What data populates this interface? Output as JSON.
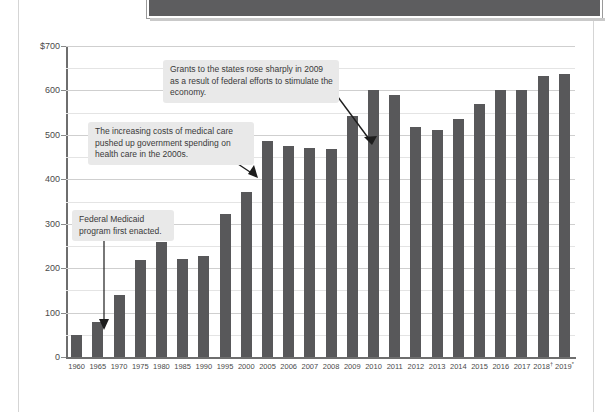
{
  "page": {
    "header_band_label": ""
  },
  "chart_data": {
    "type": "bar",
    "title": "",
    "subtitle": "",
    "xlabel": "",
    "ylabel": "",
    "ylim": [
      0,
      700
    ],
    "ytick_values": [
      0,
      100,
      200,
      300,
      400,
      500,
      600,
      700
    ],
    "ytick_labels": [
      "0",
      "100",
      "200",
      "300",
      "400",
      "500",
      "600",
      "$700"
    ],
    "grid": true,
    "legend": "none",
    "categories": [
      "1960",
      "1965",
      "1970",
      "1975",
      "1980",
      "1985",
      "1990",
      "1995",
      "2000",
      "2005",
      "2006",
      "2007",
      "2008",
      "2009",
      "2010",
      "2011",
      "2012",
      "2013",
      "2014",
      "2015",
      "2016",
      "2017",
      "2018",
      "2019"
    ],
    "category_labels": [
      "1960",
      "1965",
      "1970",
      "1975",
      "1980",
      "1985",
      "1990",
      "1995",
      "2000",
      "2005",
      "2006",
      "2007",
      "2008",
      "2009",
      "2010",
      "2011",
      "2012",
      "2013",
      "2014",
      "2015",
      "2016",
      "2017",
      "2018†",
      "2019*"
    ],
    "values": [
      50,
      78,
      140,
      218,
      260,
      220,
      227,
      323,
      372,
      487,
      475,
      470,
      468,
      543,
      602,
      590,
      518,
      510,
      535,
      570,
      600,
      600,
      633,
      638
    ],
    "bar_color": "#58585a",
    "annotations": [
      {
        "id": "grants",
        "text": "Grants to the states rose sharply in 2009 as a result of federal efforts to stimulate the economy.",
        "target_category": "2009"
      },
      {
        "id": "medical",
        "text": "The increasing costs of medical care pushed up government spending on health care in the 2000s.",
        "target_category": "2005"
      },
      {
        "id": "medicaid",
        "text": "Federal Medicaid program first enacted.",
        "target_category": "1965"
      }
    ]
  }
}
